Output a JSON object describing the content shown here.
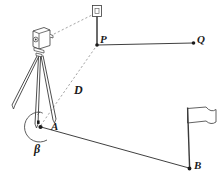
{
  "figure": {
    "type": "surveying-diagram",
    "background_color": "#ffffff",
    "stroke_color": "#2a2a2a",
    "label_color": "#1b1b1b"
  },
  "labels": {
    "point_p": "P",
    "point_q": "Q",
    "point_a": "A",
    "point_b": "B",
    "distance_d": "D",
    "angle_beta": "β"
  },
  "elements": {
    "instrument_name": "total-station-theodolite",
    "tripod_name": "tripod",
    "prism_name": "prism-target",
    "prism_pole_name": "prism-pole",
    "flag_name": "survey-flag",
    "flag_pole_name": "flag-pole",
    "angle_arc_name": "angle-beta-arc",
    "sight_line_to_prism": "dashed-sight-line-instrument-to-prism",
    "sight_line_to_a": "dashed-sight-line-instrument-to-point-a",
    "baseline_pq": "solid-line-p-to-q",
    "baseline_ab": "solid-line-a-to-b"
  },
  "geometry": {
    "point_p": {
      "x": 97,
      "y": 45
    },
    "point_q": {
      "x": 194,
      "y": 43
    },
    "point_a": {
      "x": 40,
      "y": 127
    },
    "point_b": {
      "x": 190,
      "y": 169
    },
    "instrument_center": {
      "x": 41,
      "y": 44
    },
    "prism_center": {
      "x": 97,
      "y": 11
    }
  }
}
